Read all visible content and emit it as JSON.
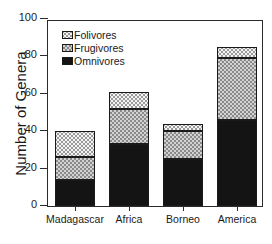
{
  "chart_data": {
    "type": "bar",
    "subtype": "stacked-vertical",
    "title": "",
    "xlabel": "",
    "ylabel": "Number of Genera",
    "ylim": [
      0,
      100
    ],
    "yticks": [
      0,
      20,
      40,
      60,
      80,
      100
    ],
    "ytick_labels": [
      "0",
      "20",
      "40",
      "60",
      "80",
      "100"
    ],
    "grid": false,
    "legend_position": "upper-left-inside",
    "categories": [
      "Madagascar",
      "Africa",
      "Borneo",
      "America"
    ],
    "series": [
      {
        "name": "Omnivores",
        "values": [
          14,
          33,
          25,
          46
        ]
      },
      {
        "name": "Frugivores",
        "values": [
          12,
          19,
          15,
          33
        ]
      },
      {
        "name": "Folivores",
        "values": [
          14,
          9,
          4,
          6
        ]
      }
    ],
    "stack_order_bottom_to_top": [
      "Omnivores",
      "Frugivores",
      "Folivores"
    ],
    "totals": [
      40,
      61,
      44,
      85
    ],
    "legend": [
      {
        "label": "Folivores",
        "swatch": "light-dotted-pattern"
      },
      {
        "label": "Frugivores",
        "swatch": "gray-checkered-pattern"
      },
      {
        "label": "Omnivores",
        "swatch": "solid-black"
      }
    ],
    "colors": {
      "omnivores": "#141414",
      "frugivores": "#d2d2d2",
      "folivores": "#f3f3f3",
      "axis": "#2b2b2b",
      "background": "#ffffff"
    }
  },
  "axis": {
    "y_title": "Number of Genera"
  },
  "caption": {
    "text": ""
  }
}
